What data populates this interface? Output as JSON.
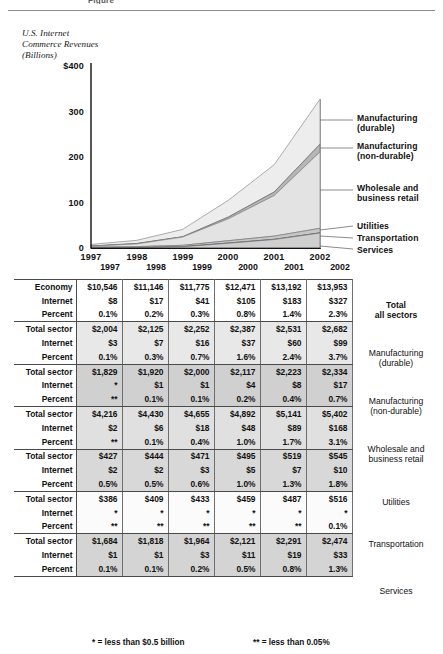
{
  "figure": {
    "title_fragment": "Figure",
    "axis_caption": "U.S. Internet\nCommerce Revenues\n(Billions)"
  },
  "chart_data": {
    "type": "area",
    "title": "U.S. Internet Commerce Revenues (Billions)",
    "xlabel": "",
    "ylabel": "U.S. Internet Commerce Revenues (Billions)",
    "ylim": [
      0,
      400
    ],
    "yticks": [
      "0",
      "100",
      "200",
      "300",
      "$400"
    ],
    "grid": false,
    "legend_position": "right",
    "stacked": true,
    "categories": [
      "1997",
      "1998",
      "1999",
      "2000",
      "2001",
      "2002"
    ],
    "series": [
      {
        "name": "Services",
        "values": [
          1,
          1,
          3,
          11,
          19,
          33
        ]
      },
      {
        "name": "Transportation",
        "values": [
          0.4,
          0.4,
          0.4,
          0.4,
          0.4,
          0.5
        ]
      },
      {
        "name": "Utilities",
        "values": [
          2,
          2,
          3,
          5,
          7,
          10
        ]
      },
      {
        "name": "Wholesale and business retail",
        "values": [
          2,
          6,
          18,
          48,
          89,
          168
        ]
      },
      {
        "name": "Manufacturing (non-durable)",
        "values": [
          0.4,
          1,
          1,
          4,
          8,
          17
        ]
      },
      {
        "name": "Manufacturing (durable)",
        "values": [
          3,
          7,
          16,
          37,
          60,
          99
        ]
      }
    ],
    "total_values": [
      8,
      17,
      41,
      105,
      183,
      327
    ]
  },
  "legend": [
    {
      "label": "Manufacturing\n(durable)"
    },
    {
      "label": "Manufacturing\n(non-durable)"
    },
    {
      "label": "Wholesale and\nbusiness retail"
    },
    {
      "label": "Utilities"
    },
    {
      "label": "Transportation"
    },
    {
      "label": "Services"
    }
  ],
  "table": {
    "columns": [
      "1997",
      "1998",
      "1999",
      "2000",
      "2001",
      "2002"
    ],
    "blocks": [
      {
        "sector": "Total\nall sectors",
        "sector_bold": true,
        "shade": "shade0",
        "rows": [
          {
            "label": "Economy",
            "values": [
              "$10,546",
              "$11,146",
              "$11,775",
              "$12,471",
              "$13,192",
              "$13,953"
            ]
          },
          {
            "label": "Internet",
            "values": [
              "$8",
              "$17",
              "$41",
              "$105",
              "$183",
              "$327"
            ]
          },
          {
            "label": "Percent",
            "values": [
              "0.1%",
              "0.2%",
              "0.3%",
              "0.8%",
              "1.4%",
              "2.3%"
            ]
          }
        ]
      },
      {
        "sector": "Manufacturing\n(durable)",
        "sector_bold": false,
        "shade": "shade1",
        "rows": [
          {
            "label": "Total sector",
            "values": [
              "$2,004",
              "$2,125",
              "$2,252",
              "$2,387",
              "$2,531",
              "$2,682"
            ]
          },
          {
            "label": "Internet",
            "values": [
              "$3",
              "$7",
              "$16",
              "$37",
              "$60",
              "$99"
            ]
          },
          {
            "label": "Percent",
            "values": [
              "0.1%",
              "0.3%",
              "0.7%",
              "1.6%",
              "2.4%",
              "3.7%"
            ]
          }
        ]
      },
      {
        "sector": "Manufacturing\n(non-durable)",
        "sector_bold": false,
        "shade": "shade2",
        "rows": [
          {
            "label": "Total sector",
            "values": [
              "$1,829",
              "$1,920",
              "$2,000",
              "$2,117",
              "$2,223",
              "$2,334"
            ]
          },
          {
            "label": "Internet",
            "values": [
              "*",
              "$1",
              "$1",
              "$4",
              "$8",
              "$17"
            ]
          },
          {
            "label": "Percent",
            "values": [
              "**",
              "0.1%",
              "0.1%",
              "0.2%",
              "0.4%",
              "0.7%"
            ]
          }
        ]
      },
      {
        "sector": "Wholesale and\nbusiness retail",
        "sector_bold": false,
        "shade": "shade3",
        "rows": [
          {
            "label": "Total sector",
            "values": [
              "$4,216",
              "$4,430",
              "$4,655",
              "$4,892",
              "$5,141",
              "$5,402"
            ]
          },
          {
            "label": "Internet",
            "values": [
              "$2",
              "$6",
              "$18",
              "$48",
              "$89",
              "$168"
            ]
          },
          {
            "label": "Percent",
            "values": [
              "**",
              "0.1%",
              "0.4%",
              "1.0%",
              "1.7%",
              "3.1%"
            ]
          }
        ]
      },
      {
        "sector": "Utilities",
        "sector_bold": false,
        "shade": "shade4",
        "rows": [
          {
            "label": "Total sector",
            "values": [
              "$427",
              "$444",
              "$471",
              "$495",
              "$519",
              "$545"
            ]
          },
          {
            "label": "Internet",
            "values": [
              "$2",
              "$2",
              "$3",
              "$5",
              "$7",
              "$10"
            ]
          },
          {
            "label": "Percent",
            "values": [
              "0.5%",
              "0.5%",
              "0.6%",
              "1.0%",
              "1.3%",
              "1.8%"
            ]
          }
        ]
      },
      {
        "sector": "Transportation",
        "sector_bold": false,
        "shade": "shade5",
        "rows": [
          {
            "label": "Total sector",
            "values": [
              "$386",
              "$409",
              "$433",
              "$459",
              "$487",
              "$516"
            ]
          },
          {
            "label": "Internet",
            "values": [
              "*",
              "*",
              "*",
              "*",
              "*",
              "*"
            ]
          },
          {
            "label": "Percent",
            "values": [
              "**",
              "**",
              "**",
              "**",
              "**",
              "0.1%"
            ]
          }
        ]
      },
      {
        "sector": "Services",
        "sector_bold": false,
        "shade": "shade6",
        "rows": [
          {
            "label": "Total sector",
            "values": [
              "$1,684",
              "$1,818",
              "$1,964",
              "$2,121",
              "$2,291",
              "$2,474"
            ]
          },
          {
            "label": "Internet",
            "values": [
              "$1",
              "$1",
              "$3",
              "$11",
              "$19",
              "$33"
            ]
          },
          {
            "label": "Percent",
            "values": [
              "0.1%",
              "0.1%",
              "0.2%",
              "0.5%",
              "0.8%",
              "1.3%"
            ]
          }
        ]
      }
    ],
    "footnotes": {
      "star": "* = less than $0.5 billion",
      "double_star": "** = less than 0.05%"
    }
  },
  "colors": {
    "axis": "#111111",
    "area_fill_light": "#ededed",
    "area_fill_mid": "#e0e0e0",
    "area_fill_dark": "#c9c9c9",
    "line": "#6f6f6f",
    "rule": "#8d8d8d"
  }
}
